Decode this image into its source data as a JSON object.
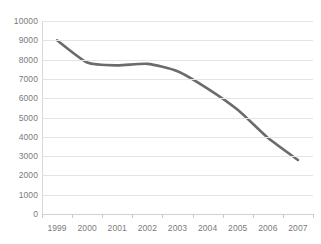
{
  "chart_data": {
    "type": "line",
    "title": "",
    "subtitle": "",
    "xlabel": "",
    "ylabel": "",
    "categories": [
      "1999",
      "2000",
      "2001",
      "2002",
      "2003",
      "2004",
      "2005",
      "2006",
      "2007"
    ],
    "values": [
      9000,
      7850,
      7700,
      7780,
      7400,
      6500,
      5400,
      3950,
      2800
    ],
    "series": [
      {
        "name": "",
        "values": [
          9000,
          7850,
          7700,
          7780,
          7400,
          6500,
          5400,
          3950,
          2800
        ]
      }
    ],
    "ylim": [
      0,
      10000
    ],
    "y_ticks": [
      0,
      1000,
      2000,
      3000,
      4000,
      5000,
      6000,
      7000,
      8000,
      9000,
      10000
    ],
    "y_tick_labels": [
      "0",
      "1000",
      "2000",
      "3000",
      "4000",
      "5000",
      "6000",
      "7000",
      "8000",
      "9000",
      "10000"
    ],
    "grid": true,
    "legend": false,
    "legend_position": "none",
    "annotations": [],
    "colors": {
      "line": "#6b6b6b",
      "grid": "#e4e4e4",
      "axis": "#d2d2d2",
      "tick_label": "#7b7b7b",
      "background": "#ffffff"
    },
    "line_width": 2.6,
    "smooth": true,
    "markers": false
  }
}
